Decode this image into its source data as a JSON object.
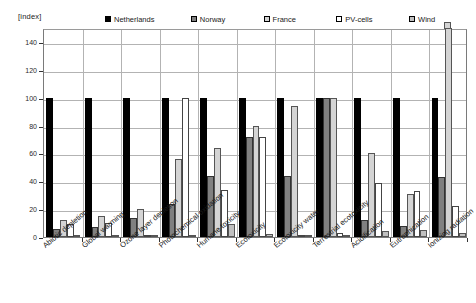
{
  "axis": {
    "index_label": "[index]",
    "y_ticks": [
      0,
      20,
      40,
      60,
      80,
      100,
      120,
      140
    ],
    "y_max": 150
  },
  "legend": {
    "items": [
      {
        "label": "Netherlands",
        "swatch": "solid-black-swatch",
        "color": "#000000"
      },
      {
        "label": "Norway",
        "swatch": "dark-gray-swatch",
        "color": "#808080"
      },
      {
        "label": "France",
        "swatch": "light-gray-swatch",
        "color": "#d4d4d4"
      },
      {
        "label": "PV-cells",
        "swatch": "white-swatch",
        "color": "#ffffff"
      },
      {
        "label": "Wind",
        "swatch": "mid-gray-swatch",
        "color": "#c0c0c0"
      }
    ]
  },
  "chart_data": {
    "type": "bar",
    "title": "",
    "subtitle": "",
    "xlabel": "",
    "ylabel": "[index]",
    "ylim": [
      0,
      150
    ],
    "grid": true,
    "legend_position": "top",
    "categories": [
      "Abiotic depletion",
      "Global warming",
      "Ozone layer depletion",
      "Photochemical oxidation",
      "Humane toxicity",
      "Ecotoxicity",
      "Ecotoxicity water",
      "Terrestrial ecotoxicity",
      "Acidification",
      "Eutrophication",
      "Ionizing radiation"
    ],
    "series": [
      {
        "name": "Netherlands",
        "color": "#000000",
        "values": [
          100,
          100,
          100,
          100,
          100,
          100,
          100,
          100,
          100,
          100,
          100
        ]
      },
      {
        "name": "Norway",
        "color": "#808080",
        "values": [
          6,
          7,
          14,
          24,
          44,
          72,
          44,
          100,
          12,
          8,
          43
        ]
      },
      {
        "name": "France",
        "color": "#d4d4d4",
        "values": [
          12,
          15,
          20,
          56,
          64,
          80,
          94,
          100,
          60,
          31,
          155
        ]
      },
      {
        "name": "PV-cells",
        "color": "#ffffff",
        "values": [
          9,
          10,
          1,
          100,
          34,
          72,
          0,
          3,
          39,
          33,
          22
        ]
      },
      {
        "name": "Wind",
        "color": "#c0c0c0",
        "values": [
          1.5,
          1.5,
          1,
          1.5,
          9,
          2,
          1,
          1,
          4,
          5,
          3
        ]
      }
    ]
  }
}
